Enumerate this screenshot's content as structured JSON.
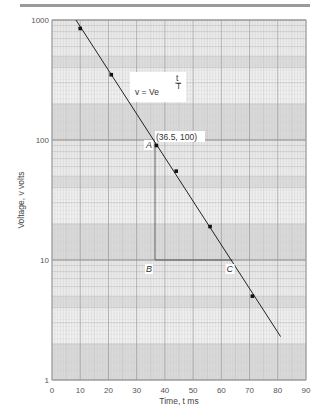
{
  "chart_data": {
    "type": "scatter",
    "title": "",
    "xlabel": "Time, t ms",
    "ylabel": "Voltage, v volts",
    "xscale": "linear",
    "yscale": "log",
    "xlim": [
      0,
      90
    ],
    "ylim": [
      1,
      1000
    ],
    "x_ticks": [
      0,
      10,
      20,
      30,
      40,
      50,
      60,
      70,
      80,
      90
    ],
    "x_tick_labels": [
      "0",
      "10",
      "20",
      "30",
      "40",
      "50",
      "60",
      "70",
      "80",
      "90"
    ],
    "y_ticks": [
      1,
      10,
      100,
      1000
    ],
    "y_tick_labels": [
      "1",
      "10",
      "100",
      "1000"
    ],
    "grid": true,
    "grid_style": "log-linear graph paper",
    "series": [
      {
        "name": "measured points",
        "type": "scatter",
        "points": [
          {
            "x": 10,
            "y": 850
          },
          {
            "x": 21,
            "y": 350
          },
          {
            "x": 37,
            "y": 90
          },
          {
            "x": 44,
            "y": 55
          },
          {
            "x": 56,
            "y": 19
          },
          {
            "x": 71,
            "y": 5
          }
        ]
      },
      {
        "name": "fitted line",
        "type": "line",
        "points": [
          {
            "x": 8.5,
            "y": 1000
          },
          {
            "x": 81,
            "y": 2.3
          }
        ]
      }
    ],
    "construction": {
      "A": {
        "label": "A",
        "x": 36.5,
        "y": 100
      },
      "B": {
        "label": "B",
        "x": 36.5,
        "y": 10
      },
      "C": {
        "label": "C",
        "x": 64,
        "y": 10
      }
    },
    "annotations": [
      {
        "text": "(36.5, 100)",
        "x": 36.5,
        "y": 100
      },
      {
        "text": "v = Ve^(-t/T)",
        "x": 27,
        "y": 320
      }
    ]
  },
  "labels": {
    "coord_A": "(36.5, 100)",
    "A": "A",
    "B": "B",
    "C": "C",
    "formula_main": "v = Ve",
    "formula_exp_num": "t",
    "formula_exp_den": "T"
  }
}
